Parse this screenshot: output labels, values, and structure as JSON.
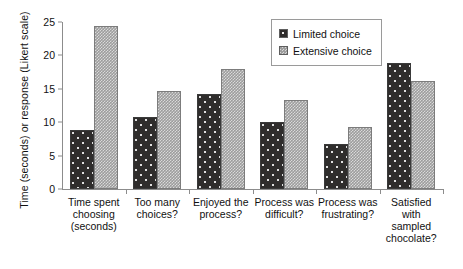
{
  "chart_data": {
    "type": "bar",
    "title": "",
    "xlabel": "",
    "ylabel": "Time (seconds) or response (Likert scale)",
    "ylim": [
      0,
      25
    ],
    "yticks": [
      0,
      5,
      10,
      15,
      20,
      25
    ],
    "grid": false,
    "legend_position": "top-right",
    "categories": [
      "Time spent choosing (seconds)",
      "Too many choices?",
      "Enjoyed the process?",
      "Process was difficult?",
      "Process was frustrating?",
      "Satisfied with sampled chocolate?"
    ],
    "category_lines": [
      [
        "Time spent",
        "choosing",
        "(seconds)"
      ],
      [
        "Too many",
        "choices?"
      ],
      [
        "Enjoyed the",
        "process?"
      ],
      [
        "Process was",
        "difficult?"
      ],
      [
        "Process was",
        "frustrating?"
      ],
      [
        "Satisfied",
        "with",
        "sampled",
        "chocolate?"
      ]
    ],
    "series": [
      {
        "name": "Limited choice",
        "color": "#2f2d2c",
        "values": [
          8.9,
          10.8,
          14.2,
          10.0,
          6.7,
          18.8
        ]
      },
      {
        "name": "Extensive choice",
        "color": "#9d9d9d",
        "values": [
          24.4,
          14.6,
          18.0,
          13.4,
          9.3,
          16.2
        ]
      }
    ]
  },
  "legend": {
    "items": [
      {
        "label": "Limited choice"
      },
      {
        "label": "Extensive choice"
      }
    ]
  },
  "axis": {
    "y_title": "Time (seconds) or response (Likert scale)",
    "y_tick_labels": [
      "0",
      "5",
      "10",
      "15",
      "20",
      "25"
    ]
  }
}
